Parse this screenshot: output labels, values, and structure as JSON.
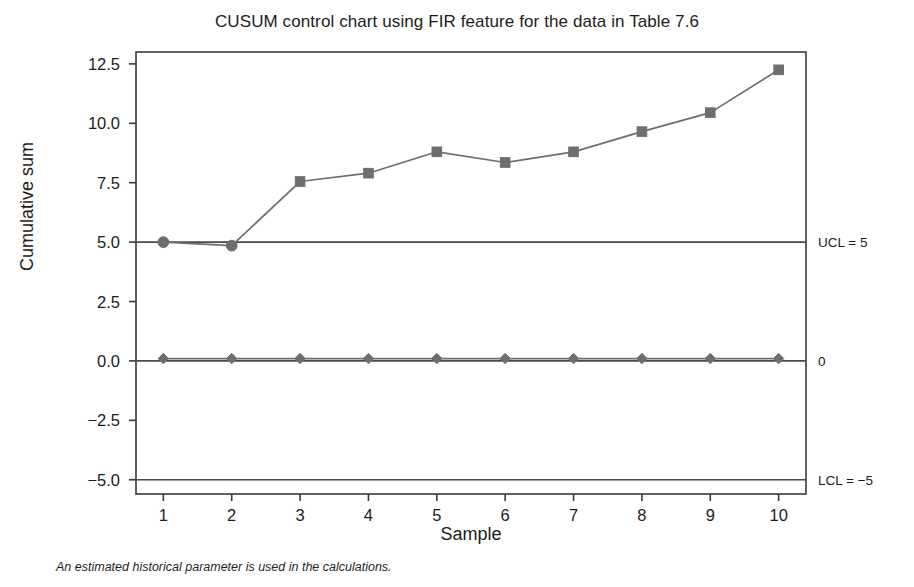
{
  "chart_data": {
    "type": "line",
    "title": "CUSUM control chart using FIR feature for the data in Table 7.6",
    "xlabel": "Sample",
    "ylabel": "Cumulative sum",
    "footnote": "An estimated historical parameter is used in the calculations.",
    "x": [
      1,
      2,
      3,
      4,
      5,
      6,
      7,
      8,
      9,
      10
    ],
    "xticklabels": [
      "1",
      "2",
      "3",
      "4",
      "5",
      "6",
      "7",
      "8",
      "9",
      "10"
    ],
    "yticks": [
      12.5,
      10.0,
      7.5,
      5.0,
      2.5,
      0.0,
      -2.5,
      -5.0
    ],
    "yticklabels": [
      "12.5",
      "10.0",
      "7.5",
      "5.0",
      "2.5",
      "0.0",
      "−2.5",
      "−5.0"
    ],
    "xlim": [
      0.6,
      10.4
    ],
    "ylim": [
      -5.6,
      13.0
    ],
    "grid": false,
    "legend": "none",
    "series": [
      {
        "name": "Upper CUSUM",
        "marker": "square-with-circle-start",
        "values": [
          5.0,
          4.85,
          7.55,
          7.9,
          8.8,
          8.35,
          8.8,
          9.65,
          10.45,
          12.25
        ]
      },
      {
        "name": "Lower CUSUM",
        "marker": "diamond",
        "values": [
          0.1,
          0.1,
          0.1,
          0.1,
          0.1,
          0.1,
          0.1,
          0.1,
          0.1,
          0.1
        ]
      }
    ],
    "reference_lines": [
      {
        "name": "ucl",
        "value": 5,
        "label": "UCL = 5"
      },
      {
        "name": "center",
        "value": 0,
        "label": "0"
      },
      {
        "name": "lcl",
        "value": -5,
        "label": "LCL = −5"
      }
    ],
    "colors": {
      "series": "#6e6e6e",
      "reference_line": "#4a4a4a",
      "axis": "#3a3a3a",
      "text": "#1c1c1c",
      "background": "#ffffff"
    }
  }
}
